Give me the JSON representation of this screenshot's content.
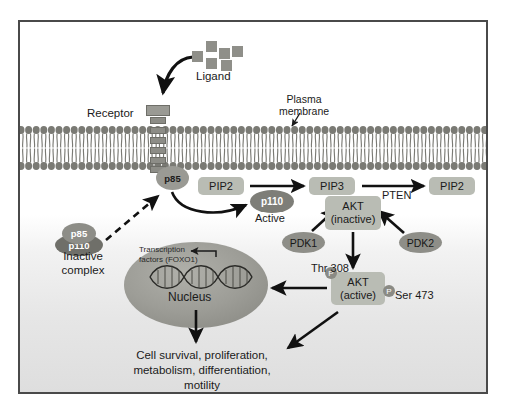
{
  "diagram": {
    "labels": {
      "ligand": "Ligand",
      "receptor": "Receptor",
      "plasma_membrane": "Plasma\nmembrane",
      "plasma_membrane_line1": "Plasma",
      "plasma_membrane_line2": "membrane",
      "active": "Active",
      "pten": "PTEN",
      "thr308": "Thr 308",
      "ser473": "Ser 473",
      "inactive_complex_line1": "Inactive",
      "inactive_complex_line2": "complex",
      "transcription_factors_line1": "Transcription",
      "transcription_factors_line2": "factors (FOXO1)",
      "nucleus": "Nucleus",
      "outcomes_line1": "Cell survival, proliferation,",
      "outcomes_line2": "metabolism, differentiation,",
      "outcomes_line3": "motility"
    },
    "nodes": {
      "pip2_left": "PIP2",
      "pip3": "PIP3",
      "pip2_right": "PIP2",
      "akt_inactive_line1": "AKT",
      "akt_inactive_line2": "(inactive)",
      "akt_active_line1": "AKT",
      "akt_active_line2": "(active)",
      "p85_membrane": "p85",
      "p110_active": "p110",
      "pdk1": "PDK1",
      "pdk2": "PDK2",
      "p85_complex": "p85",
      "p110_complex": "p110",
      "phosphate_badge": "P"
    },
    "colors": {
      "frame": "#4a4a4a",
      "membrane_head": "#7a7a74",
      "node_box": "#b9bcb4",
      "ellipse_dark": "#6f6f69",
      "ellipse_mid": "#8e8e88",
      "nucleus": "#9d9d97",
      "arrow": "#111111",
      "ligand": "#8f8f89",
      "background_top": "#ffffff",
      "background_bottom": "#dedede"
    },
    "ligand_squares": [
      {
        "x": 206,
        "y": 41
      },
      {
        "x": 192,
        "y": 51
      },
      {
        "x": 219,
        "y": 48
      },
      {
        "x": 232,
        "y": 46
      },
      {
        "x": 206,
        "y": 58
      },
      {
        "x": 221,
        "y": 60
      }
    ],
    "receptor_segments": [
      {
        "y": 2
      },
      {
        "y": 12
      },
      {
        "y": 22
      },
      {
        "y": 32
      },
      {
        "y": 42
      },
      {
        "y": 51
      }
    ],
    "edges": [
      {
        "from": "ligand",
        "to": "receptor",
        "style": "curved-solid"
      },
      {
        "from": "inactive-complex",
        "to": "p85-membrane",
        "style": "dashed"
      },
      {
        "from": "p85-membrane",
        "to": "p110-active",
        "style": "curved-solid"
      },
      {
        "from": "pip2-left",
        "to": "pip3",
        "style": "solid"
      },
      {
        "from": "pip3",
        "to": "pip2-right",
        "style": "solid",
        "label": "PTEN"
      },
      {
        "from": "pdk1",
        "to": "akt-inactive",
        "style": "solid"
      },
      {
        "from": "pdk2",
        "to": "akt-inactive",
        "style": "solid"
      },
      {
        "from": "akt-inactive",
        "to": "akt-active",
        "style": "solid"
      },
      {
        "from": "akt-active",
        "to": "nucleus",
        "style": "solid"
      },
      {
        "from": "akt-active",
        "to": "outcomes",
        "style": "solid"
      },
      {
        "from": "nucleus",
        "to": "outcomes",
        "style": "solid"
      },
      {
        "from": "transcription-factors",
        "to": "dna-helix",
        "style": "solid"
      }
    ]
  }
}
